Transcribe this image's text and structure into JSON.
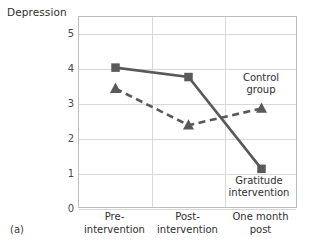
{
  "figure": {
    "panel_label": "(a)",
    "y_axis_title": "Depression"
  },
  "chart_data": {
    "type": "line",
    "title": "",
    "ylabel": "Depression",
    "xlabel": "",
    "categories": [
      "Pre-intervention",
      "Post-intervention",
      "One month post"
    ],
    "category_lines": [
      [
        "Pre-",
        "intervention"
      ],
      [
        "Post-",
        "intervention"
      ],
      [
        "One month",
        "post"
      ]
    ],
    "ylim": [
      0,
      5.5
    ],
    "yticks": [
      0,
      1,
      2,
      3,
      4,
      5
    ],
    "ytick_labels": [
      "0",
      "1",
      "2",
      "3",
      "4",
      "5"
    ],
    "grid": true,
    "legend_position": "inline-annotation",
    "series": [
      {
        "name": "Gratitude intervention",
        "label_lines": [
          "Gratitude",
          "intervention"
        ],
        "values": [
          4.05,
          3.78,
          1.15
        ],
        "marker": "square",
        "linestyle": "solid",
        "color": "#595959"
      },
      {
        "name": "Control group",
        "label_lines": [
          "Control",
          "group"
        ],
        "values": [
          3.45,
          2.4,
          2.88
        ],
        "marker": "triangle",
        "linestyle": "dashed",
        "color": "#595959"
      }
    ],
    "colors": {
      "series_line": "#595959",
      "gridline": "#d8d8d8",
      "frame": "#bdbdbd",
      "text": "#2e2e2e"
    }
  }
}
